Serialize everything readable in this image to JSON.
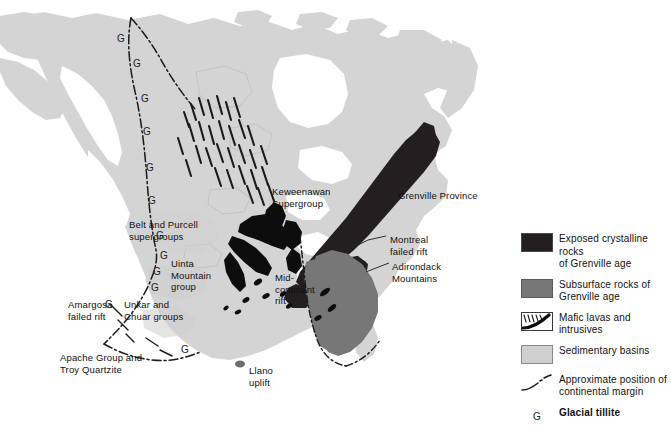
{
  "figure": {
    "type": "geologic-map",
    "region": "North America",
    "background_color": "#ffffff",
    "land_color": "#d4d4d4",
    "exposed_color": "#231f20",
    "subsurface_color": "#777777",
    "sedimentary_color": "#cfcfcf"
  },
  "map_labels": [
    {
      "id": "keweenawan",
      "text": "Keweenawan\nSupergroup",
      "x": 272,
      "y": 186
    },
    {
      "id": "grenville-province",
      "text": "Grenville Province",
      "x": 398,
      "y": 190
    },
    {
      "id": "belt-purcell",
      "text": "Belt and Purcell\nsupergroups",
      "x": 129,
      "y": 219
    },
    {
      "id": "montreal-failed-rift",
      "text": "Montreal\nfailed rift",
      "x": 390,
      "y": 234
    },
    {
      "id": "uinta-mountain",
      "text": "Uinta\nMountain\ngroup",
      "x": 171,
      "y": 258
    },
    {
      "id": "mid-continent-rift",
      "text": "Mid-\ncontinent\nrift",
      "x": 275,
      "y": 272
    },
    {
      "id": "adirondack",
      "text": "Adirondack\nMountains",
      "x": 392,
      "y": 261
    },
    {
      "id": "amargosa",
      "text": "Amargosa\nfailed rift",
      "x": 68,
      "y": 299
    },
    {
      "id": "unkar-chuar",
      "text": "Unkar and\nChuar groups",
      "x": 124,
      "y": 299
    },
    {
      "id": "apache-troy",
      "text": "Apache Group and\nTroy Quartzite",
      "x": 60,
      "y": 352
    },
    {
      "id": "llano-uplift",
      "text": "Llano\nuplift",
      "x": 249,
      "y": 365
    }
  ],
  "glacial_tillite_marks": [
    {
      "x": 117,
      "y": 34
    },
    {
      "x": 133,
      "y": 59
    },
    {
      "x": 141,
      "y": 94
    },
    {
      "x": 143,
      "y": 127
    },
    {
      "x": 146,
      "y": 163
    },
    {
      "x": 148,
      "y": 196
    },
    {
      "x": 156,
      "y": 231
    },
    {
      "x": 160,
      "y": 251
    },
    {
      "x": 153,
      "y": 267
    },
    {
      "x": 151,
      "y": 283
    },
    {
      "x": 105,
      "y": 300
    },
    {
      "x": 181,
      "y": 345
    }
  ],
  "legend": {
    "items": [
      {
        "id": "exposed-crystalline",
        "swatch": "filled-dark",
        "label": "Exposed crystalline rocks\nof Grenville age",
        "bold": false
      },
      {
        "id": "subsurface-rocks",
        "swatch": "filled-gray",
        "label": "Subsurface rocks of\nGrenville age",
        "bold": false
      },
      {
        "id": "mafic-lavas",
        "swatch": "hatch-swoosh",
        "label": "Mafic lavas and intrusives",
        "bold": false
      },
      {
        "id": "sedimentary-basins",
        "swatch": "filled-light",
        "label": "Sedimentary basins",
        "bold": false
      },
      {
        "id": "continental-margin",
        "swatch": "dashed-line",
        "label": "Approximate position of\ncontinental margin",
        "bold": false
      },
      {
        "id": "glacial-tillite",
        "swatch": "letter-g",
        "label": "Glacial tillite",
        "bold": true,
        "glyph": "G"
      }
    ]
  }
}
